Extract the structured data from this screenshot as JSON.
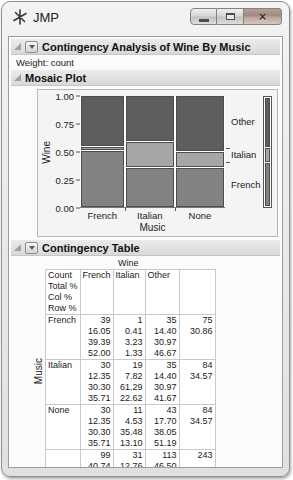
{
  "window": {
    "title": "JMP"
  },
  "icons": {
    "close": "×"
  },
  "outline_headers": {
    "analysis": "Contingency Analysis of Wine By Music",
    "mosaic": "Mosaic Plot",
    "table": "Contingency Table"
  },
  "weight_note": "Weight: count",
  "chart_data": {
    "type": "mosaic",
    "title": "Mosaic Plot",
    "xlabel": "Music",
    "ylabel": "Wine",
    "y_ticks": [
      "1.00",
      "0.75",
      "0.50",
      "0.25",
      "0.00"
    ],
    "x_categories": [
      "French",
      "Italian",
      "None"
    ],
    "column_counts": [
      75,
      84,
      84
    ],
    "grand_total": 243,
    "column_width_pct": [
      30.86,
      34.57,
      34.57
    ],
    "colors": {
      "Other": "#5e5e5e",
      "Italian": "#a6a6a6",
      "French": "#828282"
    },
    "columns": [
      {
        "category": "French",
        "segments": [
          {
            "wine": "Other",
            "pct": 46.67
          },
          {
            "wine": "Italian",
            "pct": 1.33
          },
          {
            "wine": "French",
            "pct": 52.0
          }
        ]
      },
      {
        "category": "Italian",
        "segments": [
          {
            "wine": "Other",
            "pct": 41.67
          },
          {
            "wine": "Italian",
            "pct": 22.62
          },
          {
            "wine": "French",
            "pct": 35.71
          }
        ]
      },
      {
        "category": "None",
        "segments": [
          {
            "wine": "Other",
            "pct": 51.19
          },
          {
            "wine": "Italian",
            "pct": 13.1
          },
          {
            "wine": "French",
            "pct": 35.71
          }
        ]
      }
    ],
    "overall_segments": [
      {
        "wine": "Other",
        "pct": 46.5
      },
      {
        "wine": "Italian",
        "pct": 12.76
      },
      {
        "wine": "French",
        "pct": 40.74
      }
    ],
    "right_labels": [
      {
        "label": "Other",
        "axis_value": 0.78
      },
      {
        "label": "Italian",
        "axis_value": 0.48
      },
      {
        "label": "French",
        "axis_value": 0.21
      }
    ]
  },
  "contingency_table": {
    "col_group_label": "Wine",
    "row_group_label": "Music",
    "cell_legend": [
      "Count",
      "Total %",
      "Col %",
      "Row %"
    ],
    "columns": [
      "French",
      "Italian",
      "Other"
    ],
    "rows": [
      {
        "label": "French",
        "lines": [
          [
            "39",
            "1",
            "35",
            "75"
          ],
          [
            "16.05",
            "0.41",
            "14.40",
            "30.86"
          ],
          [
            "39.39",
            "3.23",
            "30.97",
            ""
          ],
          [
            "52.00",
            "1.33",
            "46.67",
            ""
          ]
        ]
      },
      {
        "label": "Italian",
        "lines": [
          [
            "30",
            "19",
            "35",
            "84"
          ],
          [
            "12.35",
            "7.82",
            "14.40",
            "34.57"
          ],
          [
            "30.30",
            "61.29",
            "30.97",
            ""
          ],
          [
            "35.71",
            "22.62",
            "41.67",
            ""
          ]
        ]
      },
      {
        "label": "None",
        "lines": [
          [
            "30",
            "11",
            "43",
            "84"
          ],
          [
            "12.35",
            "4.53",
            "17.70",
            "34.57"
          ],
          [
            "30.30",
            "35.48",
            "38.05",
            ""
          ],
          [
            "35.71",
            "13.10",
            "51.19",
            ""
          ]
        ]
      },
      {
        "label": "",
        "lines": [
          [
            "99",
            "31",
            "113",
            "243"
          ],
          [
            "40.74",
            "12.76",
            "46.50",
            ""
          ]
        ]
      }
    ]
  }
}
